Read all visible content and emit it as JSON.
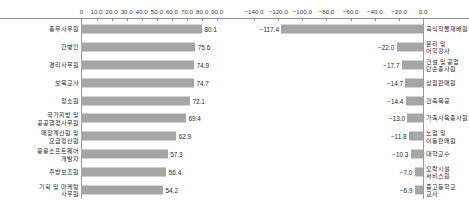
{
  "chart_data": [
    {
      "type": "bar",
      "orientation": "horizontal",
      "panel": "left",
      "title": "",
      "xlabel": "",
      "ylabel": "",
      "xlim": [
        0,
        90
      ],
      "grid": false,
      "tick_labels": [
        "0",
        "10.0",
        "20.0",
        "30.0",
        "40.0",
        "50.0",
        "60.0",
        "70.0",
        "80.0",
        "90.0"
      ],
      "ticks": [
        0,
        10,
        20,
        30,
        40,
        50,
        60,
        70,
        80,
        90
      ],
      "bar_color": "#a6a6a6",
      "categories": [
        "총무사무원",
        "간병인",
        "경리사무원",
        "보육교사",
        "청소원",
        "국가지방 및\n공공행정사무원",
        "매장계산원 및\n요금정산원",
        "응용소프트웨어\n개발자",
        "주방보조원",
        "기획 및 마케팅\n사무원"
      ],
      "values": [
        80.1,
        75.6,
        74.9,
        74.7,
        72.1,
        69.4,
        62.9,
        57.3,
        56.4,
        54.2
      ],
      "value_labels": [
        "80.1",
        "75.6",
        "74.9",
        "74.7",
        "72.1",
        "69.4",
        "62.9",
        "57.3",
        "56.4",
        "54.2"
      ]
    },
    {
      "type": "bar",
      "orientation": "horizontal",
      "panel": "right",
      "title": "",
      "xlabel": "",
      "ylabel": "",
      "xlim": [
        -140,
        0
      ],
      "grid": false,
      "tick_labels": [
        "-140.0",
        "-120.0",
        "-100.0",
        "-80.0",
        "-60.0",
        "-40.0",
        "-20.0",
        "0.0"
      ],
      "ticks": [
        -140,
        -120,
        -100,
        -80,
        -60,
        -40,
        -20,
        0
      ],
      "bar_color": "#a6a6a6",
      "categories": [
        "곡식작물재배원",
        "문리 및\n어학강사",
        "건설 및 공업\n단순종사원",
        "상점판매원",
        "건축목공",
        "가축사육종사원",
        "노점 및\n이동판매원",
        "대학교수",
        "오락시설\n서비스원",
        "중고등학교\n교사"
      ],
      "values": [
        -117.4,
        -22.0,
        -17.7,
        -14.7,
        -14.4,
        -13.0,
        -11.8,
        -10.3,
        -7.0,
        -6.9
      ],
      "value_labels": [
        "-117.4",
        "-22.0",
        "-17.7",
        "-14.7",
        "-14.4",
        "-13.0",
        "-11.8",
        "-10.3",
        "-7.0",
        "-6.9"
      ]
    }
  ]
}
